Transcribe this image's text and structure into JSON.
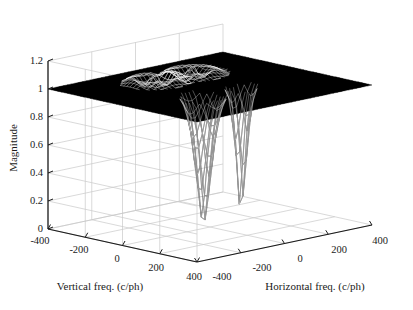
{
  "figure": {
    "kind": "matlab-3d-surface-mesh",
    "background_color": "#ffffff",
    "grid_color": "#c9c9c9",
    "axis_color": "#1a1a1a",
    "mesh_color": "#000000"
  },
  "labels": {
    "zaxis": "Magnitude",
    "xaxis": "Horizontal freq. (c/ph)",
    "yaxis": "Vertical freq. (c/ph)"
  },
  "ticks": {
    "z": [
      "1.2",
      "1",
      "0.8",
      "0.6",
      "0.4",
      "0.2",
      "0"
    ],
    "vertical": [
      "-400",
      "-200",
      "0",
      "200",
      "400"
    ],
    "horizontal": [
      "-400",
      "-200",
      "0",
      "200",
      "400"
    ]
  },
  "chart_data": {
    "type": "surface",
    "title": "",
    "xlabel": "Horizontal freq. (c/ph)",
    "ylabel": "Vertical freq. (c/ph)",
    "zlabel": "Magnitude",
    "xlim": [
      -400,
      400
    ],
    "ylim": [
      -400,
      400
    ],
    "zlim": [
      0,
      1.2
    ],
    "xticks": [
      -400,
      -200,
      0,
      200,
      400
    ],
    "yticks": [
      -400,
      -200,
      0,
      200,
      400
    ],
    "zticks": [
      0,
      0.2,
      0.4,
      0.6,
      0.8,
      1.0,
      1.2
    ],
    "grid": true,
    "legend": "none",
    "baseline_value": 1.0,
    "features": [
      {
        "name": "notch-null-1",
        "x": -60,
        "y": -60,
        "z_min": 0.0,
        "width": 60
      },
      {
        "name": "notch-null-2",
        "x": 110,
        "y": -60,
        "z_min": 0.0,
        "width": 40
      },
      {
        "name": "ripple-patch-1",
        "x": -60,
        "y": 150,
        "z": 1.0
      },
      {
        "name": "ripple-patch-2",
        "x": 110,
        "y": 150,
        "z": 1.0
      }
    ],
    "surface_note": "z = 1 everywhere except two narrow funnel nulls reaching z = 0"
  }
}
